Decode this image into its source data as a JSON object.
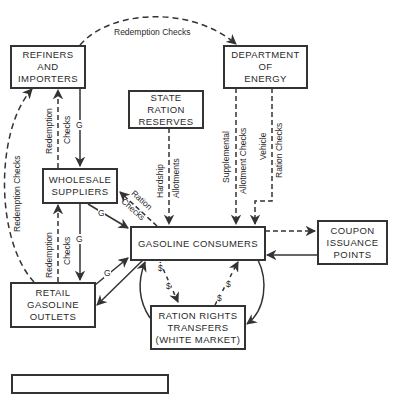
{
  "diagram": {
    "nodes": {
      "refiners": {
        "line1": "REFINERS",
        "line2": "AND",
        "line3": "IMPORTERS"
      },
      "doe": {
        "line1": "DEPARTMENT",
        "line2": "OF",
        "line3": "ENERGY"
      },
      "state_reserves": {
        "line1": "STATE",
        "line2": "RATION",
        "line3": "RESERVES"
      },
      "wholesale": {
        "line1": "WHOLESALE",
        "line2": "SUPPLIERS"
      },
      "consumers": {
        "line1": "GASOLINE CONSUMERS"
      },
      "coupon": {
        "line1": "COUPON",
        "line2": "ISSUANCE",
        "line3": "POINTS"
      },
      "retail": {
        "line1": "RETAIL",
        "line2": "GASOLINE",
        "line3": "OUTLETS"
      },
      "ration_rights": {
        "line1": "RATION RIGHTS",
        "line2": "TRANSFERS",
        "line3": "(WHITE MARKET)"
      },
      "legend_box": {
        "line1": ""
      }
    },
    "edge_labels": {
      "top_redemption": "Redemption Checks",
      "retail_to_refiners": "Redemption Checks",
      "wholesale_to_refiners_1": "Redemption",
      "wholesale_to_refiners_2": "Checks",
      "refiners_to_wholesale_g": "G",
      "retail_to_wholesale_1": "Redemption",
      "retail_to_wholesale_2": "Checks",
      "wholesale_to_retail_g": "G",
      "wholesale_to_consumers_g": "G",
      "retail_to_consumers_g": "G",
      "consumers_to_wholesale_1": "Ration",
      "consumers_to_wholesale_2": "Checks",
      "hardship_1": "Hardship",
      "hardship_2": "Allotments",
      "supplemental_1": "Supplemental",
      "supplemental_2": "Allotment Checks",
      "vehicle_1": "Vehicle",
      "vehicle_2": "Ration Checks",
      "dollar": "$"
    },
    "colors": {
      "line": "#333333",
      "text": "#2a2a2a",
      "background": "#ffffff"
    }
  }
}
